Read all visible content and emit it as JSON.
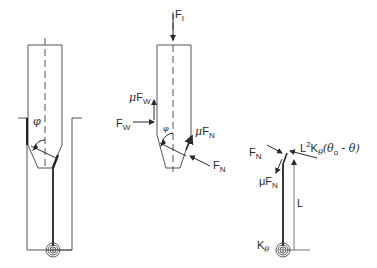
{
  "figure_1": {
    "angle_label": "φ"
  },
  "figure_2": {
    "force_top": {
      "main": "F",
      "sub": "I"
    },
    "friction_wall": {
      "mu": "μ",
      "main": "F",
      "sub": "W"
    },
    "wall_force": {
      "main": "F",
      "sub": "W"
    },
    "angle_label": "φ",
    "friction_normal": {
      "mu": "μ",
      "main": "F",
      "sub": "N"
    },
    "normal_force": {
      "main": "F",
      "sub": "N"
    }
  },
  "figure_3": {
    "normal_force": {
      "main": "F",
      "sub": "N"
    },
    "moment": {
      "L": "L",
      "sup": "2",
      "K": "K",
      "ksub": "θ",
      "expr": "(θ",
      "o": "o",
      "rest": " - θ)"
    },
    "friction_normal": {
      "mu": "μ",
      "main": "F",
      "sub": "N"
    },
    "length_label": "L",
    "spring_label": {
      "main": "K",
      "sub": "θ"
    }
  },
  "colors": {
    "line": "#3a3a3a",
    "thin": "#555555",
    "label": "#2a2a2a"
  }
}
